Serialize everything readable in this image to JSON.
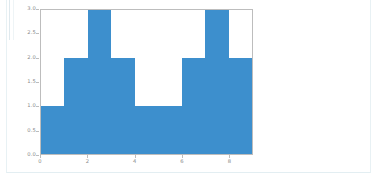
{
  "page": {
    "background_color": "#ffffff",
    "frame_border_color": "#e8f1f4"
  },
  "figure": {
    "name": "histogram-figure",
    "bar_color": "#3d8fcd",
    "axis_color": "#bdbdbd",
    "tick_label_color": "#8a8a8a"
  },
  "chart_data": {
    "type": "bar",
    "title": "",
    "xlabel": "",
    "ylabel": "",
    "grid": false,
    "legend": null,
    "xlim": [
      0,
      9
    ],
    "ylim": [
      0.0,
      3.0
    ],
    "bin_edges": [
      0,
      1,
      2,
      3,
      4,
      5,
      6,
      7,
      8,
      9
    ],
    "categories": [
      "0-1",
      "1-2",
      "2-3",
      "3-4",
      "4-5",
      "5-6",
      "6-7",
      "7-8",
      "8-9"
    ],
    "values": [
      1,
      2,
      3,
      2,
      1,
      1,
      2,
      3,
      2
    ],
    "xticks": [
      "0",
      "2",
      "4",
      "6",
      "8"
    ],
    "xtick_values": [
      0,
      2,
      4,
      6,
      8
    ],
    "yticks": [
      "0.0",
      "0.5",
      "1.0",
      "1.5",
      "2.0",
      "2.5",
      "3.0"
    ],
    "ytick_values": [
      0.0,
      0.5,
      1.0,
      1.5,
      2.0,
      2.5,
      3.0
    ]
  }
}
